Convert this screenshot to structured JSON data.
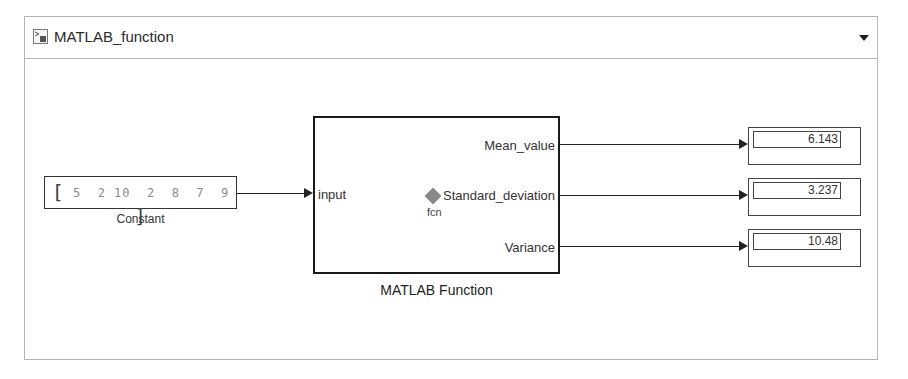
{
  "header": {
    "model_name": "MATLAB_function",
    "model_icon": "simulink-model-icon",
    "dropdown_icon": "chevron-down-icon"
  },
  "constant_block": {
    "label": "Constant",
    "open_bracket": "[",
    "values_text": "5  2 10  2  8  7  9",
    "close_bracket": "]",
    "values": [
      5,
      2,
      10,
      2,
      8,
      7,
      9
    ]
  },
  "matlab_function_block": {
    "label": "MATLAB Function",
    "input_port": "input",
    "output_ports": [
      "Mean_value",
      "Standard_deviation",
      "Variance"
    ],
    "function_name": "fcn"
  },
  "displays": [
    {
      "port": "Mean_value",
      "value": "6.143"
    },
    {
      "port": "Standard_deviation",
      "value": "3.237"
    },
    {
      "port": "Variance",
      "value": "10.48"
    }
  ]
}
